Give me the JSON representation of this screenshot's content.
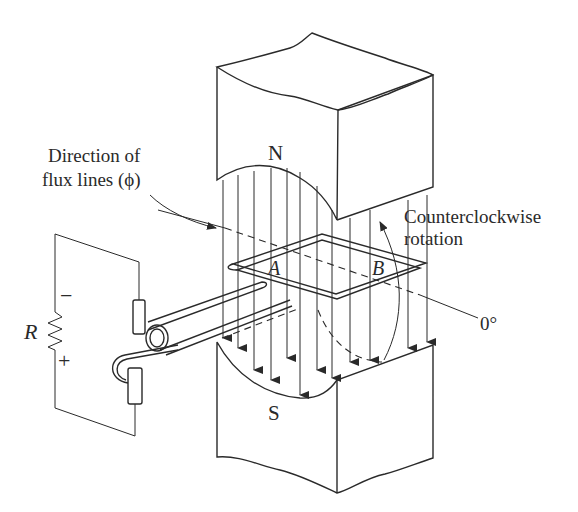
{
  "figure": {
    "type": "diagram",
    "labels": {
      "flux_line1": "Direction of",
      "flux_line2": "flux lines (ϕ)",
      "north_pole": "N",
      "south_pole": "S",
      "rotation_line1": "Counterclockwise",
      "rotation_line2": "rotation",
      "side_a": "A",
      "side_b": "B",
      "angle_ref": "0°",
      "resistor": "R",
      "minus": "−",
      "plus": "+"
    },
    "colors": {
      "ink": "#2a2a2a",
      "background": "#ffffff"
    }
  }
}
